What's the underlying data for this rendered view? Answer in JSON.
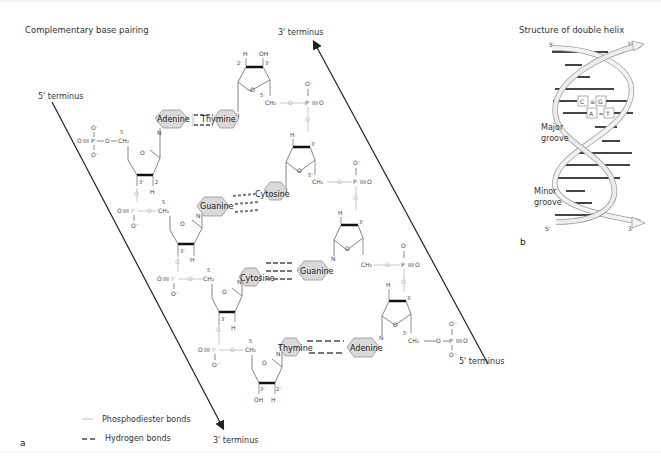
{
  "figure": {
    "panel_a": {
      "title": "Complementary base pairing",
      "panel_label": "a",
      "strand_left": {
        "top_label": "5' terminus",
        "bottom_label": "3' terminus"
      },
      "strand_right": {
        "top_label": "3' terminus",
        "bottom_label": "5' terminus"
      },
      "base_pairs": [
        {
          "left": "Adenine",
          "right": "Thymine",
          "hydrogen_bonds": 2
        },
        {
          "left": "Guanine",
          "right": "Cytosine",
          "hydrogen_bonds": 3
        },
        {
          "left": "Cytosine",
          "right": "Guanine",
          "hydrogen_bonds": 3
        },
        {
          "left": "Thymine",
          "right": "Adenine",
          "hydrogen_bonds": 2
        }
      ],
      "atoms": {
        "oxygen": "O",
        "oxygen_minus": "O⁻",
        "phosphorus": "P",
        "nitrogen": "N",
        "hydrogen": "H",
        "hydroxyl": "OH",
        "ch2": "CH₂",
        "pos_5": "5'",
        "pos_3": "3'",
        "pos_2": "2'"
      },
      "legend": [
        {
          "label": "Phosphodiester bonds",
          "style": "thin-light-line"
        },
        {
          "label": "Hydrogen bonds",
          "style": "dashed-gray"
        }
      ]
    },
    "panel_b": {
      "title": "Structure of double helix",
      "panel_label": "b",
      "end_labels": {
        "top_left": "5'",
        "top_right": "3'",
        "bottom_left": "5'",
        "bottom_right": "3'"
      },
      "pairs": [
        {
          "left": "C",
          "right": "G",
          "bond": "≡"
        },
        {
          "left": "A",
          "right": "T",
          "bond": "="
        }
      ],
      "grooves": {
        "major": "Major groove",
        "major_l1": "Major",
        "major_l2": "groove",
        "minor": "Minor groove",
        "minor_l1": "Minor",
        "minor_l2": "groove"
      }
    },
    "colors": {
      "base_fill": "#d9d9d9",
      "base_stroke": "#888888",
      "bond_gray": "#777777",
      "phosphodiester": "#bdbdbd",
      "arrow": "#222222"
    }
  }
}
